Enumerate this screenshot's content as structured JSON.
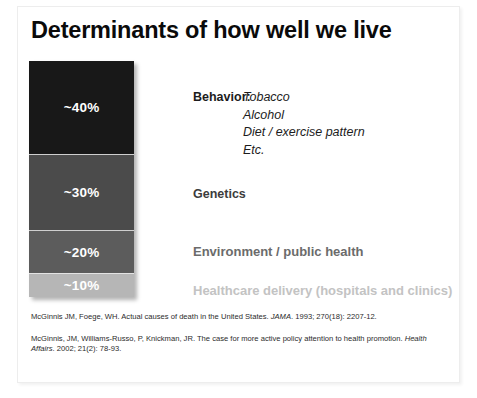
{
  "slide": {
    "title": "Determinants of how well we live"
  },
  "chart_data": {
    "type": "bar",
    "orientation": "vertical-stacked",
    "title": "Determinants of how well we live",
    "xlabel": "",
    "ylabel": "",
    "categories": [
      "Behavior",
      "Genetics",
      "Environment / public health",
      "Healthcare delivery (hospitals and clinics)"
    ],
    "values": [
      40,
      30,
      20,
      10
    ],
    "value_labels": [
      "~40%",
      "~30%",
      "~20%",
      "~10%"
    ],
    "segment_colors": [
      "#181818",
      "#4b4b4b",
      "#5c5c5c",
      "#b6b6b6"
    ],
    "label_colors": [
      "#1c1c1c",
      "#3c3c3c",
      "#6b6b6b",
      "#c3c3c3"
    ],
    "grid": false,
    "legend": "right-of-bar"
  },
  "segments": [
    {
      "label": "~40%",
      "value": 40
    },
    {
      "label": "~30%",
      "value": 30
    },
    {
      "label": "~20%",
      "value": 20
    },
    {
      "label": "~10%",
      "value": 10
    }
  ],
  "categories": {
    "behavior": {
      "label": "Behavior:",
      "items": [
        "Tobacco",
        "Alcohol",
        "Diet / exercise pattern",
        "Etc."
      ]
    },
    "genetics": {
      "label": "Genetics"
    },
    "environment": {
      "label": "Environment / public health"
    },
    "healthcare": {
      "label": "Healthcare delivery (hospitals and clinics)"
    }
  },
  "citations": [
    {
      "part1": "McGinnis JM, Foege, WH. Actual causes of death in the United States. ",
      "journal": "JAMA",
      "part2": ". 1993; 270(18): 2207-12."
    },
    {
      "part1": "McGinnis, JM, Williams-Russo, P, Knickman, JR. The case for more active policy attention to health promotion. ",
      "journal": "Health Affairs",
      "part2": ". 2002; 21(2): 78-93."
    }
  ]
}
